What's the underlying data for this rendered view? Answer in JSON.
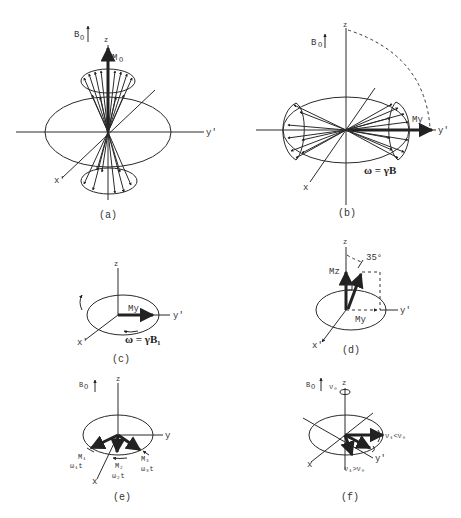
{
  "panels": {
    "a": {
      "caption": "(a)",
      "field_label": "B",
      "field_sub": "O",
      "z_label": "z",
      "m_label": "M",
      "m_sub": "O",
      "x_label": "x'",
      "y_label": "y'"
    },
    "b": {
      "caption": "(b)",
      "field_label": "B",
      "field_sub": "O",
      "z_label": "z",
      "m_label": "My",
      "x_label": "x",
      "y_label": "y'",
      "equation": "ω = γB"
    },
    "c": {
      "caption": "(c)",
      "z_label": "z",
      "m_label": "My",
      "x_label": "x'",
      "y_label": "y'",
      "equation": "ω = γB₁"
    },
    "d": {
      "caption": "(d)",
      "z_label": "z",
      "angle_label": "35°",
      "mz_label": "Mz",
      "my_label": "My",
      "x_label": "x'",
      "y_label": "y'"
    },
    "e": {
      "caption": "(e)",
      "field_label": "B",
      "field_sub": "O",
      "z_label": "z",
      "x_label": "x",
      "y_label": "y",
      "m1": "M₁",
      "m2": "M₂",
      "m3": "M₃",
      "w1": "ω₁t",
      "w2": "ω₂t",
      "w3": "ω₃t"
    },
    "f": {
      "caption": "(f)",
      "field_label": "B",
      "field_sub": "O",
      "z_label": "z",
      "nu0_label": "ν₀",
      "x_label": "x",
      "y_label": "y'",
      "nu_less": "ν₁<ν₀",
      "nu_greater": "ν₁>ν₀"
    }
  }
}
